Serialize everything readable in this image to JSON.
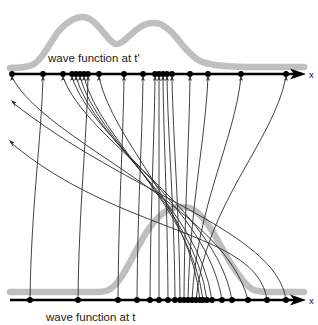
{
  "figure": {
    "title_top_label": "wave function at t'",
    "title_bottom_label": "wave function at t",
    "axis_top_label": "x",
    "axis_bottom_label": "x",
    "colors": {
      "wave": "#bfbfbf",
      "axis": "#000000",
      "trajectory": "#2b2b2b",
      "dot": "#000000",
      "background": "#ffffff"
    },
    "geometry": {
      "top_axis_y": 74,
      "bottom_axis_y": 300,
      "axis_x_start": 10,
      "axis_x_end": 304
    }
  },
  "chart_data": {
    "type": "line",
    "xlabel": "x",
    "ylabel": "",
    "xlim": [
      0,
      318
    ],
    "grid": false,
    "legend": null,
    "series": [
      {
        "name": "wave function at t'",
        "kind": "wave-envelope",
        "axis": "top",
        "baseline_y": 74,
        "points": [
          [
            10,
            68
          ],
          [
            24,
            67
          ],
          [
            34,
            64
          ],
          [
            42,
            56
          ],
          [
            50,
            44
          ],
          [
            58,
            32
          ],
          [
            66,
            24
          ],
          [
            74,
            19
          ],
          [
            82,
            17
          ],
          [
            90,
            19
          ],
          [
            97,
            25
          ],
          [
            104,
            33
          ],
          [
            110,
            40
          ],
          [
            116,
            44
          ],
          [
            122,
            42
          ],
          [
            128,
            37
          ],
          [
            136,
            30
          ],
          [
            144,
            25
          ],
          [
            152,
            23
          ],
          [
            160,
            24
          ],
          [
            168,
            29
          ],
          [
            176,
            37
          ],
          [
            184,
            47
          ],
          [
            192,
            55
          ],
          [
            200,
            61
          ],
          [
            210,
            64
          ],
          [
            224,
            66
          ],
          [
            244,
            67
          ],
          [
            268,
            67
          ],
          [
            290,
            67
          ],
          [
            304,
            67
          ]
        ]
      },
      {
        "name": "wave function at t",
        "kind": "wave-envelope",
        "axis": "bottom",
        "baseline_y": 292,
        "points": [
          [
            10,
            292
          ],
          [
            40,
            292
          ],
          [
            70,
            292
          ],
          [
            95,
            292
          ],
          [
            106,
            291
          ],
          [
            114,
            286
          ],
          [
            122,
            276
          ],
          [
            130,
            262
          ],
          [
            138,
            247
          ],
          [
            146,
            233
          ],
          [
            154,
            222
          ],
          [
            162,
            214
          ],
          [
            170,
            209
          ],
          [
            180,
            207
          ],
          [
            190,
            208
          ],
          [
            198,
            213
          ],
          [
            206,
            222
          ],
          [
            214,
            234
          ],
          [
            222,
            248
          ],
          [
            230,
            262
          ],
          [
            238,
            274
          ],
          [
            246,
            284
          ],
          [
            252,
            289
          ],
          [
            258,
            291
          ],
          [
            268,
            292
          ],
          [
            284,
            292
          ],
          [
            304,
            292
          ]
        ]
      }
    ],
    "top_axis_markers": [
      12,
      43,
      63,
      72,
      76,
      80,
      84,
      88,
      99,
      124,
      143,
      155,
      159,
      163,
      167,
      172,
      190,
      208,
      241,
      286
    ],
    "bottom_axis_markers": [
      30,
      78,
      118,
      137,
      150,
      159,
      168,
      175,
      180,
      184,
      188,
      192,
      196,
      200,
      203,
      207,
      212,
      222,
      232,
      248,
      267,
      286
    ],
    "trajectories": [
      {
        "from": 30,
        "to": 43,
        "note": "rightward"
      },
      {
        "from": 78,
        "to": 88,
        "note": "rightward"
      },
      {
        "from": 118,
        "to": 124,
        "note": "rightward"
      },
      {
        "from": 137,
        "to": 143,
        "note": "rightward"
      },
      {
        "from": 150,
        "to": 155,
        "note": "rightward"
      },
      {
        "from": 159,
        "to": 159,
        "note": "vertical"
      },
      {
        "from": 168,
        "to": 163,
        "note": "leftward"
      },
      {
        "from": 175,
        "to": 167,
        "note": "leftward"
      },
      {
        "from": 180,
        "to": 172,
        "note": "leftward"
      },
      {
        "from": 184,
        "to": 190,
        "note": "rightward"
      },
      {
        "from": 188,
        "to": 208,
        "note": "rightward"
      },
      {
        "from": 192,
        "to": 241,
        "note": "rightward"
      },
      {
        "from": 196,
        "to": 286,
        "note": "rightward"
      },
      {
        "from": 200,
        "to": 99,
        "note": "leftward"
      },
      {
        "from": 203,
        "to": 84,
        "note": "leftward"
      },
      {
        "from": 207,
        "to": 80,
        "note": "leftward"
      },
      {
        "from": 212,
        "to": 76,
        "note": "leftward"
      },
      {
        "from": 222,
        "to": 72,
        "note": "leftward"
      },
      {
        "from": 232,
        "to": 63,
        "note": "leftward"
      },
      {
        "from": 248,
        "to": 12,
        "note": "leftward-far"
      },
      {
        "from": 267,
        "to": 8,
        "note": "exits-left-edge"
      },
      {
        "from": 286,
        "to": 10,
        "note": "exits-left-edge"
      }
    ]
  }
}
